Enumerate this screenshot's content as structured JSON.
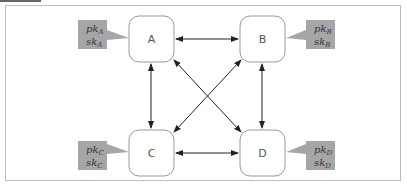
{
  "diagram": {
    "title": "",
    "nodes": [
      {
        "id": "A",
        "label": "A",
        "pk": "pk",
        "sk": "sk",
        "sub": "A"
      },
      {
        "id": "B",
        "label": "B",
        "pk": "pk",
        "sk": "sk",
        "sub": "B"
      },
      {
        "id": "C",
        "label": "C",
        "pk": "pk",
        "sk": "sk",
        "sub": "C"
      },
      {
        "id": "D",
        "label": "D",
        "pk": "pk",
        "sk": "sk",
        "sub": "D"
      }
    ],
    "edges": [
      {
        "from": "A",
        "to": "B",
        "type": "bidirectional"
      },
      {
        "from": "A",
        "to": "C",
        "type": "bidirectional"
      },
      {
        "from": "A",
        "to": "D",
        "type": "bidirectional"
      },
      {
        "from": "B",
        "to": "C",
        "type": "bidirectional"
      },
      {
        "from": "B",
        "to": "D",
        "type": "bidirectional"
      },
      {
        "from": "C",
        "to": "D",
        "type": "bidirectional"
      }
    ],
    "colors": {
      "key_box": "#a6a6a6",
      "node_border": "#999999",
      "arrow": "#222222",
      "frame": "#bdbdbd"
    }
  }
}
